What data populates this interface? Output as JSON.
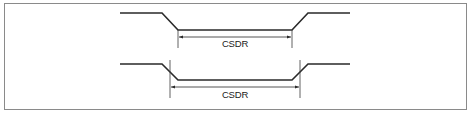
{
  "diagram": {
    "type": "timing-diagram",
    "border_color": "#8a8a8a",
    "line_color": "#2a2a2a",
    "waveforms": [
      {
        "id": "waveform-top",
        "high_y": 13,
        "low_y": 30,
        "points": [
          [
            120,
            13
          ],
          [
            162,
            13
          ],
          [
            178,
            30
          ],
          [
            292,
            30
          ],
          [
            308,
            13
          ],
          [
            350,
            13
          ]
        ],
        "markers": [
          {
            "x": 178,
            "y1": 30,
            "y2": 48
          },
          {
            "x": 292,
            "y1": 30,
            "y2": 48
          }
        ],
        "dimension": {
          "x1": 178,
          "x2": 292,
          "y": 37,
          "label": "CSDR",
          "label_x": 235,
          "label_y": 47
        }
      },
      {
        "id": "waveform-bottom",
        "high_y": 64,
        "low_y": 80,
        "points": [
          [
            120,
            64
          ],
          [
            162,
            64
          ],
          [
            178,
            80
          ],
          [
            292,
            80
          ],
          [
            308,
            64
          ],
          [
            350,
            64
          ]
        ],
        "markers": [
          {
            "x": 170,
            "y1": 60,
            "y2": 98
          },
          {
            "x": 300,
            "y1": 60,
            "y2": 98
          }
        ],
        "dimension": {
          "x1": 170,
          "x2": 300,
          "y": 87,
          "label": "CSDR",
          "label_x": 235,
          "label_y": 98
        }
      }
    ]
  }
}
